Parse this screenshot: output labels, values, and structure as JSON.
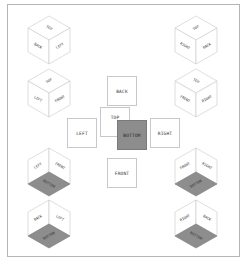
{
  "net": {
    "back": "BACK",
    "top": "TOP",
    "left": "LEFT",
    "bottom": "BOTTOM",
    "right": "RIGHT",
    "front": "FRONT"
  },
  "cubes": {
    "top_left_1": {
      "top": "TOP",
      "left": "BACK",
      "right": "LEFT"
    },
    "top_left_2": {
      "top": "TOP",
      "left": "LEFT",
      "right": "FRONT"
    },
    "top_right_1": {
      "top": "TOP",
      "left": "RIGHT",
      "right": "BACK"
    },
    "top_right_2": {
      "top": "TOP",
      "left": "FRONT",
      "right": "RIGHT"
    },
    "bottom_left_1": {
      "left": "LEFT",
      "right": "FRONT",
      "bottom": "BOTTOM"
    },
    "bottom_left_2": {
      "left": "BACK",
      "right": "LEFT",
      "bottom": "BOTTOM"
    },
    "bottom_right_1": {
      "left": "FRONT",
      "right": "RIGHT",
      "bottom": "BOTTOM"
    },
    "bottom_right_2": {
      "left": "RIGHT",
      "right": "BACK",
      "bottom": "BOTTOM"
    }
  },
  "colors": {
    "bottom_face": "#8d8d8d",
    "stroke": "#c8c8c8"
  }
}
